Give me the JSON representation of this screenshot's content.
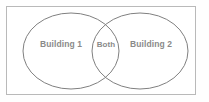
{
  "diagram": {
    "type": "venn",
    "title": "",
    "background_color": "#fefefe",
    "frame": {
      "name": "diagram-frame",
      "border_color": "#b9b9b9",
      "fill_color": "#ffffff"
    },
    "stroke_color": "#808080",
    "label_color": "#8a8a8a",
    "sets": [
      {
        "id": "left",
        "label": "Building 1",
        "cx": 71,
        "cy": 51,
        "rx": 48,
        "ry": 38,
        "label_x": 61,
        "label_y": 45
      },
      {
        "id": "right",
        "label": "Building 2",
        "cx": 140,
        "cy": 51,
        "rx": 48,
        "ry": 38,
        "label_x": 151,
        "label_y": 45
      }
    ],
    "intersection": {
      "id": "both",
      "label": "Both",
      "label_x": 106,
      "label_y": 45
    }
  }
}
